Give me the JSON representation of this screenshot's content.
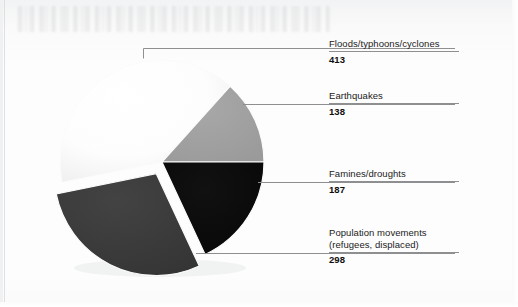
{
  "chart_data": {
    "type": "pie",
    "title": "",
    "subtitle": "",
    "xlabel": "",
    "ylabel": "",
    "grid": false,
    "legend_position": "right-leader-labels",
    "value_total": 1036,
    "categories": [
      "Floods/typhoons/cyclones",
      "Earthquakes",
      "Famines/droughts",
      "Population movements (refugees, displaced)"
    ],
    "values": [
      413,
      138,
      187,
      298
    ],
    "percentages": [
      39.9,
      13.3,
      18.1,
      28.8
    ],
    "slice_colors": [
      "#fdfdfd",
      "#a0a0a0",
      "#0b0b0b",
      "#3c3c3c"
    ],
    "slices": [
      {
        "label": "Floods/typhoons/cyclones",
        "label_line2": "",
        "value": "413",
        "value_number": 413,
        "percent": 39.9,
        "color": "#fdfdfd",
        "start_angle_deg": 168.5,
        "sweep_deg": 143.5,
        "exploded": false
      },
      {
        "label": "Earthquakes",
        "label_line2": "",
        "value": "138",
        "value_number": 138,
        "percent": 13.3,
        "color": "#a0a0a0",
        "start_angle_deg": 312.0,
        "sweep_deg": 48.0,
        "exploded": false
      },
      {
        "label": "Famines/droughts",
        "label_line2": "",
        "value": "187",
        "value_number": 187,
        "percent": 18.1,
        "color": "#0b0b0b",
        "start_angle_deg": 0.0,
        "sweep_deg": 65.0,
        "exploded": false
      },
      {
        "label": "Population movements",
        "label_line2": "(refugees, displaced)",
        "value": "298",
        "value_number": 298,
        "percent": 28.8,
        "color": "#3c3c3c",
        "start_angle_deg": 65.0,
        "sweep_deg": 103.5,
        "exploded": true
      }
    ]
  },
  "colors": {
    "background": "#fcfcfc",
    "slice_white": "#fdfdfd",
    "slice_mid_gray": "#a0a0a0",
    "slice_black": "#0b0b0b",
    "slice_dark_gray": "#3c3c3c",
    "leader_line": "#8d8f91",
    "label_text": "#1b1b1b"
  }
}
